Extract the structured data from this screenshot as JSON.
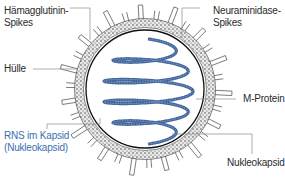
{
  "diagram": {
    "labels": {
      "hemagglutinin_1": "Hämagglutinin-",
      "hemagglutinin_2": "Spikes",
      "neuraminidase_1": "Neuraminidase-",
      "neuraminidase_2": "Spikes",
      "envelope": "Hülle",
      "m_protein": "M-Protein",
      "rna_1": "RNS im Kapsid",
      "rna_2": "(Nukleokapsid)",
      "nucleocapsid": "Nukleokapsid"
    },
    "colors": {
      "line": "#333333",
      "leader": "#8a8a8a",
      "envelope_fill": "#e6e6e6",
      "helix": "#4a6fa5",
      "helix_dots": "#1f3f7a",
      "rna_label": "#3c6fb0"
    }
  }
}
